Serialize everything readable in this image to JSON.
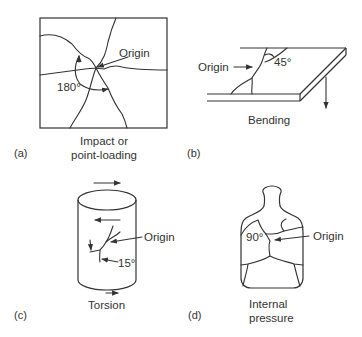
{
  "figure": {
    "panels": [
      {
        "id": "a",
        "letter": "(a)",
        "caption_line1": "Impact or",
        "caption_line2": "point-loading",
        "origin_label": "Origin",
        "angle_label": "180°"
      },
      {
        "id": "b",
        "letter": "(b)",
        "caption_line1": "Bending",
        "origin_label": "Origin",
        "angle_label": "45°"
      },
      {
        "id": "c",
        "letter": "(c)",
        "caption_line1": "Torsion",
        "origin_label": "Origin",
        "angle_label": "15°"
      },
      {
        "id": "d",
        "letter": "(d)",
        "caption_line1": "Internal",
        "caption_line2": "pressure",
        "origin_label": "Origin",
        "angle_label": "90°"
      }
    ]
  }
}
